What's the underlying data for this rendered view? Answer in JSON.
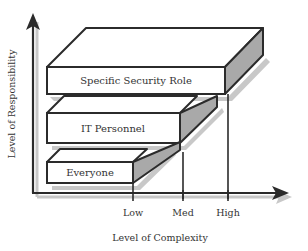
{
  "diagram": {
    "y_axis_label": "Level of Responsibility",
    "x_axis_label": "Level of Complexity",
    "x_ticks": [
      "Low",
      "Med",
      "High"
    ],
    "boxes": [
      {
        "label": "Everyone",
        "complexity": "Low"
      },
      {
        "label": "IT Personnel",
        "complexity": "Med"
      },
      {
        "label": "Specific Security Role",
        "complexity": "High"
      }
    ],
    "colors": {
      "line": "#2b2b2b",
      "box_front": "#ffffff",
      "box_side": "#a9a9a9",
      "shadow": "#c8c8c8"
    }
  }
}
